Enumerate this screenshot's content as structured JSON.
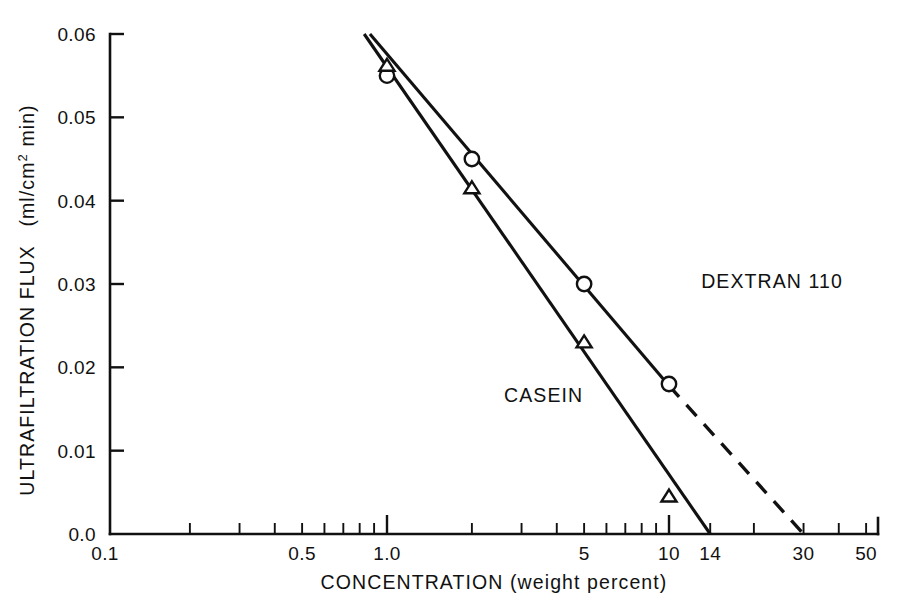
{
  "chart_data": {
    "type": "line",
    "title": "",
    "xlabel": "CONCENTRATION (weight percent)",
    "ylabel": "ULTRAFILTRATION FLUX (ml/cm² min)",
    "ylabel_main": "ULTRAFILTRATION FLUX",
    "ylabel_units": "(ml/cm",
    "ylabel_units_sup": "2",
    "ylabel_units_tail": " min)",
    "xscale": "log",
    "yscale": "linear",
    "xlim": [
      0.1,
      50
    ],
    "ylim": [
      0.0,
      0.06
    ],
    "grid": false,
    "legend_position": "inline-annotations",
    "x_tick_labels": [
      "0.1",
      "0.5",
      "1.0",
      "5",
      "10",
      "14",
      "30",
      "50"
    ],
    "x_tick_values": [
      0.1,
      0.5,
      1.0,
      5,
      10,
      14,
      30,
      50
    ],
    "x_minor_ticks": [
      0.2,
      0.3,
      0.4,
      0.6,
      0.7,
      0.8,
      0.9,
      2,
      3,
      4,
      6,
      7,
      8,
      9,
      20,
      40
    ],
    "y_tick_labels": [
      "0.0",
      "0.01",
      "0.02",
      "0.03",
      "0.04",
      "0.05",
      "0.06"
    ],
    "y_tick_values": [
      0.0,
      0.01,
      0.02,
      0.03,
      0.04,
      0.05,
      0.06
    ],
    "series": [
      {
        "name": "DEXTRAN 110",
        "marker": "circle",
        "label_x": 13.0,
        "label_y": 0.0295,
        "points": [
          {
            "x": 1.0,
            "y": 0.055
          },
          {
            "x": 2.0,
            "y": 0.045
          },
          {
            "x": 5.0,
            "y": 0.03
          },
          {
            "x": 10.0,
            "y": 0.018
          }
        ],
        "fit_solid": [
          {
            "x": 0.87,
            "y": 0.06
          },
          {
            "x": 10.0,
            "y": 0.0178
          }
        ],
        "fit_dashed": [
          {
            "x": 10.0,
            "y": 0.0178
          },
          {
            "x": 30.0,
            "y": 0.0
          }
        ]
      },
      {
        "name": "CASEIN",
        "marker": "triangle",
        "label_x": 2.6,
        "label_y": 0.0158,
        "points": [
          {
            "x": 1.0,
            "y": 0.0562
          },
          {
            "x": 2.0,
            "y": 0.0415
          },
          {
            "x": 5.0,
            "y": 0.023
          },
          {
            "x": 10.0,
            "y": 0.0045
          }
        ],
        "fit_solid": [
          {
            "x": 0.83,
            "y": 0.06
          },
          {
            "x": 14.0,
            "y": 0.0
          }
        ],
        "fit_dashed": []
      }
    ],
    "annotations": [
      {
        "text": "DEXTRAN 110",
        "x": 13.0,
        "y": 0.0295
      },
      {
        "text": "CASEIN",
        "x": 2.6,
        "y": 0.0158
      }
    ]
  }
}
